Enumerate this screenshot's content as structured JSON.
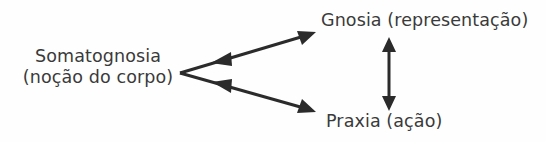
{
  "diagram": {
    "background_color": "#fefefe",
    "stroke_color": "#2b2b2b",
    "text_color": "#3a3a3a",
    "nodes": {
      "somatognosia": {
        "line1": "Somatognosia",
        "line2": "(noção do corpo)"
      },
      "gnosia": {
        "label": "Gnosia (representação)"
      },
      "praxia": {
        "label": "Praxia (ação)"
      }
    },
    "connectors": [
      {
        "name": "somatognosia-gnosia",
        "from": "somatognosia",
        "to": "gnosia",
        "style": "double-headed-arrow"
      },
      {
        "name": "somatognosia-praxia",
        "from": "somatognosia",
        "to": "praxia",
        "style": "double-headed-arrow"
      },
      {
        "name": "gnosia-praxia",
        "from": "gnosia",
        "to": "praxia",
        "style": "double-headed-arrow"
      }
    ]
  }
}
